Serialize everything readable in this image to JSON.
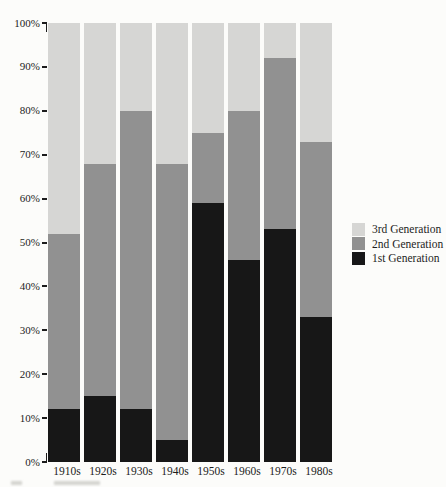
{
  "page": {
    "background": "#fcfcfa",
    "text_color": "#1c1c1c"
  },
  "chart_data": {
    "type": "bar",
    "stacked": true,
    "title": "",
    "xlabel": "",
    "ylabel": "",
    "categories": [
      "1910s",
      "1920s",
      "1930s",
      "1940s",
      "1950s",
      "1960s",
      "1970s",
      "1980s"
    ],
    "series": [
      {
        "name": "1st Generation",
        "color": "#171717",
        "values": [
          12,
          15,
          12,
          5,
          59,
          46,
          53,
          33
        ]
      },
      {
        "name": "2nd Generation",
        "color": "#919191",
        "values": [
          40,
          53,
          68,
          63,
          16,
          34,
          39,
          40
        ]
      },
      {
        "name": "3rd Generation",
        "color": "#d6d6d4",
        "values": [
          48,
          32,
          20,
          32,
          25,
          20,
          8,
          27
        ]
      }
    ],
    "cumulative_tops_pct": {
      "1st_generation_top": [
        12,
        15,
        12,
        5,
        59,
        46,
        53,
        33
      ],
      "2nd_generation_top": [
        52,
        68,
        80,
        68,
        75,
        80,
        92,
        73
      ],
      "3rd_generation_top": [
        100,
        100,
        100,
        100,
        100,
        100,
        100,
        100
      ]
    },
    "ylim": [
      0,
      100
    ],
    "yticks": [
      "100%",
      "90%",
      "80%",
      "70%",
      "60%",
      "50%",
      "40%",
      "30%",
      "20%",
      "10%",
      "0%"
    ],
    "grid": false,
    "legend": {
      "position": "right-middle",
      "items": [
        "3rd Generation",
        "2nd Generation",
        "1st Generation"
      ]
    }
  }
}
